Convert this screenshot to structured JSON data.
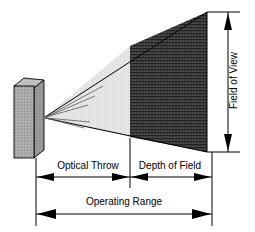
{
  "diagram": {
    "type": "technical-line-diagram",
    "background_color": "#ffffff",
    "line_color": "#000000"
  },
  "labels": {
    "optical_throw": "Optical Throw",
    "depth_of_field": "Depth of Field",
    "operating_range": "Operating Range",
    "field_of_view": "Field of View"
  },
  "elements": {
    "projector": {
      "name": "projector-body",
      "shape": "3d-rectangular-prism",
      "fill_color": "#a8a8a8",
      "texture": "stipple"
    },
    "optical_throw_zone": {
      "name": "optical-throw-region",
      "fill_color": "#e3e3e3",
      "texture": "light-stipple",
      "description": "near, out-of-focus light cone section"
    },
    "depth_of_field_zone": {
      "name": "depth-of-field-region",
      "fill_color": "#3a3a3a",
      "texture": "dense-horizontal-hatch",
      "description": "in-focus light cone section"
    },
    "rays": {
      "name": "projection-rays",
      "count": 5,
      "color": "#555555"
    }
  },
  "dimensions": {
    "rows": [
      {
        "name": "optical-throw-dimension",
        "label_key": "optical_throw",
        "arrow_style": "double-headed"
      },
      {
        "name": "depth-of-field-dimension",
        "label_key": "depth_of_field",
        "arrow_style": "double-headed"
      },
      {
        "name": "operating-range-dimension",
        "label_key": "operating_range",
        "arrow_style": "double-headed"
      },
      {
        "name": "field-of-view-dimension",
        "label_key": "field_of_view",
        "arrow_style": "double-headed-vertical"
      }
    ]
  }
}
